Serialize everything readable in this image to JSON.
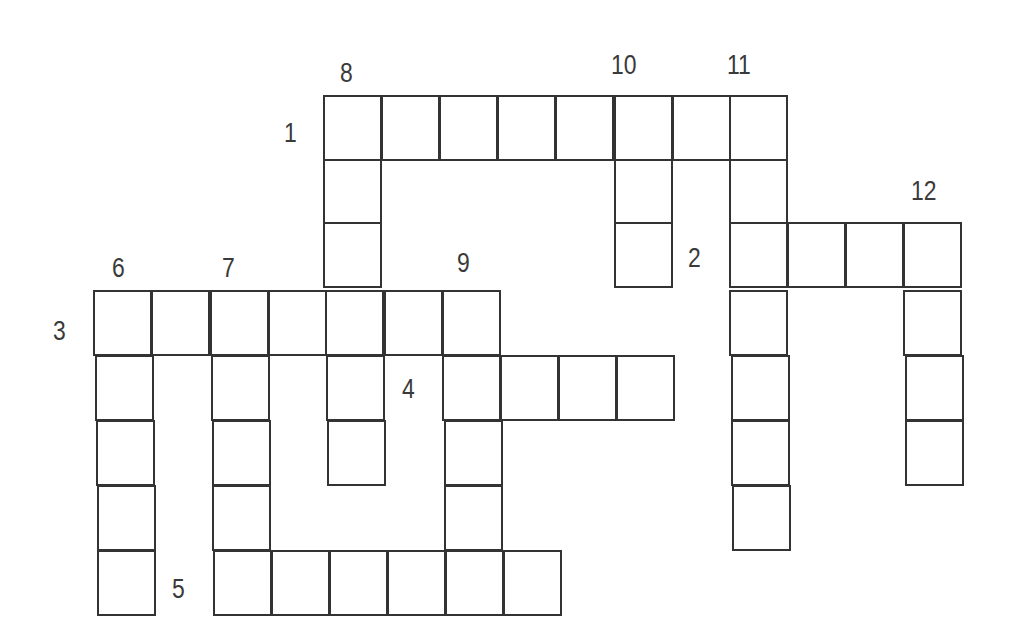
{
  "puzzle": {
    "type": "crossword",
    "colors": {
      "line": "#333333",
      "label": "#3a3a3a",
      "background": "#ffffff"
    },
    "cell_size": {
      "width": 59,
      "height": 66
    },
    "clue_numbers": [
      {
        "number": "1",
        "x": 284,
        "y": 120
      },
      {
        "number": "2",
        "x": 688,
        "y": 245
      },
      {
        "number": "3",
        "x": 53,
        "y": 318
      },
      {
        "number": "4",
        "x": 402,
        "y": 376
      },
      {
        "number": "5",
        "x": 172,
        "y": 576
      },
      {
        "number": "6",
        "x": 112,
        "y": 255
      },
      {
        "number": "7",
        "x": 222,
        "y": 255
      },
      {
        "number": "8",
        "x": 340,
        "y": 60
      },
      {
        "number": "9",
        "x": 457,
        "y": 250
      },
      {
        "number": "10",
        "x": 611,
        "y": 52
      },
      {
        "number": "11",
        "x": 727,
        "y": 52
      },
      {
        "number": "12",
        "x": 911,
        "y": 178
      }
    ],
    "entries": [
      {
        "number": "1",
        "direction": "across",
        "length": 8
      },
      {
        "number": "2",
        "direction": "across",
        "length": 4
      },
      {
        "number": "3",
        "direction": "across",
        "length": 7
      },
      {
        "number": "4",
        "direction": "across",
        "length": 4
      },
      {
        "number": "5",
        "direction": "across",
        "length": 6
      },
      {
        "number": "6",
        "direction": "down",
        "length": 5
      },
      {
        "number": "7",
        "direction": "down",
        "length": 5
      },
      {
        "number": "8",
        "direction": "down",
        "length": 6
      },
      {
        "number": "9",
        "direction": "down",
        "length": 5
      },
      {
        "number": "10",
        "direction": "down",
        "length": 3
      },
      {
        "number": "11",
        "direction": "down",
        "length": 7
      },
      {
        "number": "12",
        "direction": "down",
        "length": 4
      }
    ],
    "cells": [
      [
        323,
        95
      ],
      [
        381,
        95
      ],
      [
        439,
        95
      ],
      [
        497,
        95
      ],
      [
        555,
        95
      ],
      [
        614,
        95
      ],
      [
        672,
        95
      ],
      [
        729,
        95
      ],
      [
        323,
        159
      ],
      [
        614,
        159
      ],
      [
        729,
        159
      ],
      [
        323,
        222
      ],
      [
        614,
        222
      ],
      [
        729,
        222
      ],
      [
        787,
        222
      ],
      [
        845,
        222
      ],
      [
        903,
        222
      ],
      [
        93,
        290
      ],
      [
        151,
        290
      ],
      [
        210,
        290
      ],
      [
        268,
        290
      ],
      [
        325,
        290
      ],
      [
        384,
        290
      ],
      [
        442,
        290
      ],
      [
        729,
        290
      ],
      [
        903,
        290
      ],
      [
        95,
        355
      ],
      [
        211,
        355
      ],
      [
        326,
        355
      ],
      [
        442,
        355
      ],
      [
        500,
        355
      ],
      [
        558,
        355
      ],
      [
        616,
        355
      ],
      [
        731,
        355
      ],
      [
        905,
        355
      ],
      [
        96,
        420
      ],
      [
        212,
        420
      ],
      [
        327,
        420
      ],
      [
        444,
        420
      ],
      [
        731,
        420
      ],
      [
        905,
        420
      ],
      [
        97,
        485
      ],
      [
        212,
        485
      ],
      [
        444,
        485
      ],
      [
        732,
        485
      ],
      [
        97,
        550
      ],
      [
        213,
        550
      ],
      [
        271,
        550
      ],
      [
        329,
        550
      ],
      [
        387,
        550
      ],
      [
        445,
        550
      ],
      [
        503,
        550
      ]
    ]
  }
}
